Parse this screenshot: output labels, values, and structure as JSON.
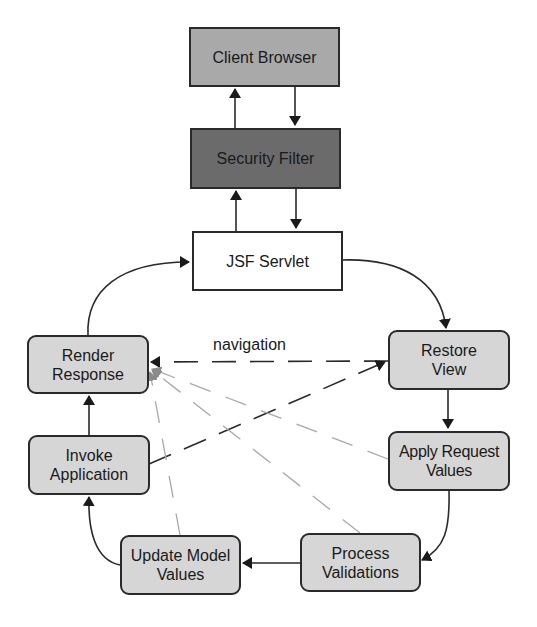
{
  "diagram": {
    "nodes": {
      "client_browser": "Client Browser",
      "security_filter": "Security Filter",
      "jsf_servlet": "JSF Servlet",
      "restore_view": "Restore View",
      "apply_request_values": "Apply Request Values",
      "process_validations": "Process Validations",
      "update_model_values": "Update Model Values",
      "invoke_application": "Invoke Application",
      "render_response": "Render Response"
    },
    "edge_labels": {
      "navigation": "navigation"
    },
    "edges": [
      {
        "from": "Client Browser",
        "to": "Security Filter",
        "style": "solid"
      },
      {
        "from": "Security Filter",
        "to": "Client Browser",
        "style": "solid"
      },
      {
        "from": "Security Filter",
        "to": "JSF Servlet",
        "style": "solid"
      },
      {
        "from": "JSF Servlet",
        "to": "Security Filter",
        "style": "solid"
      },
      {
        "from": "JSF Servlet",
        "to": "Restore View",
        "style": "solid"
      },
      {
        "from": "Restore View",
        "to": "Apply Request Values",
        "style": "solid"
      },
      {
        "from": "Apply Request Values",
        "to": "Process Validations",
        "style": "solid"
      },
      {
        "from": "Process Validations",
        "to": "Update Model Values",
        "style": "solid"
      },
      {
        "from": "Update Model Values",
        "to": "Invoke Application",
        "style": "solid"
      },
      {
        "from": "Invoke Application",
        "to": "Render Response",
        "style": "solid"
      },
      {
        "from": "Render Response",
        "to": "JSF Servlet",
        "style": "solid"
      },
      {
        "from": "Restore View",
        "to": "Render Response",
        "style": "dashed",
        "label": "navigation"
      },
      {
        "from": "Invoke Application",
        "to": "Restore View",
        "style": "dashed"
      },
      {
        "from": "Apply Request Values",
        "to": "Render Response",
        "style": "dashed-gray"
      },
      {
        "from": "Process Validations",
        "to": "Render Response",
        "style": "dashed-gray"
      },
      {
        "from": "Update Model Values",
        "to": "Render Response",
        "style": "dashed-gray"
      }
    ],
    "colors": {
      "client_browser_fill": "#a9a9a9",
      "security_filter_fill": "#6b6b6b",
      "jsf_servlet_fill": "#ffffff",
      "phase_fill": "#d6d6d6",
      "stroke": "#2a2a2a",
      "gray_dash": "#a8a8a8"
    }
  }
}
